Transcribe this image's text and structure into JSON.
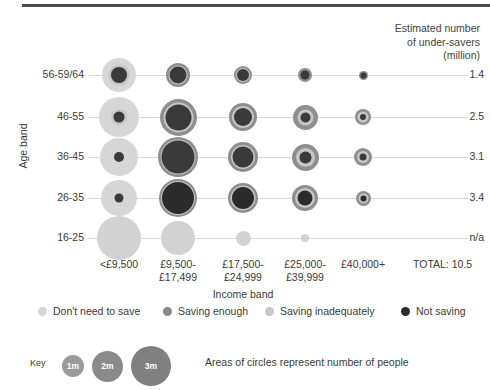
{
  "header_note": {
    "line1": "Estimated number",
    "line2": "of under-savers",
    "line3": "(million)"
  },
  "axis": {
    "y_title": "Age band",
    "x_title": "Income band"
  },
  "legend": {
    "items": [
      {
        "label": "Don't need to save",
        "color": "#d6d6d6"
      },
      {
        "label": "Saving enough",
        "color": "#8a8a8a"
      },
      {
        "label": "Saving inadequately",
        "color": "#c6c6c6"
      },
      {
        "label": "Not saving",
        "color": "#2b2b2b"
      }
    ]
  },
  "key": {
    "label": "Key",
    "note": "Areas of circles represent number of people",
    "sizes": [
      {
        "label": "1m",
        "d": 22,
        "color": "#9a9a9a"
      },
      {
        "label": "2m",
        "d": 31,
        "color": "#8a8a8a"
      },
      {
        "label": "3m",
        "d": 40,
        "color": "#808080"
      }
    ]
  },
  "chart_data": {
    "type": "bubble",
    "xlabel": "Income band",
    "ylabel": "Age band",
    "categories": [
      "<£9,500",
      "£9,500-\n£17,499",
      "£17,500-\n£24,999",
      "£25,000-\n£39,999",
      "£40,000+"
    ],
    "x_labels": [
      {
        "l1": "<£9,500",
        "l2": ""
      },
      {
        "l1": "£9,500-",
        "l2": "£17,499"
      },
      {
        "l1": "£17,500-",
        "l2": "£24,999"
      },
      {
        "l1": "£25,000-",
        "l2": "£39,999"
      },
      {
        "l1": "£40,000+",
        "l2": ""
      }
    ],
    "total_label": "TOTAL: 10.5",
    "rows": [
      {
        "age": "56-59/64",
        "under_savers": "1.4"
      },
      {
        "age": "46-55",
        "under_savers": "2.5"
      },
      {
        "age": "36-45",
        "under_savers": "3.1"
      },
      {
        "age": "26-35",
        "under_savers": "3.4"
      },
      {
        "age": "16-25",
        "under_savers": "n/a"
      }
    ],
    "series": [
      {
        "name": "Don't need to save",
        "color": "#d6d6d6"
      },
      {
        "name": "Saving enough",
        "color": "#8a8a8a"
      },
      {
        "name": "Saving inadequately",
        "color": "#c6c6c6"
      },
      {
        "name": "Not saving",
        "color": "#2b2b2b"
      }
    ],
    "bubbles": [
      {
        "row": 0,
        "col": 0,
        "rings": [
          {
            "series": "Don't need to save",
            "color": "#d6d6d6",
            "d": 34
          },
          {
            "series": "Saving inadequately",
            "color": "#c6c6c6",
            "d": 21
          },
          {
            "series": "Not saving",
            "color": "#3a3a3a",
            "d": 16
          }
        ]
      },
      {
        "row": 0,
        "col": 1,
        "rings": [
          {
            "series": "Saving enough",
            "color": "#8e8e8e",
            "d": 24
          },
          {
            "series": "Saving inadequately",
            "color": "#c6c6c6",
            "d": 19
          },
          {
            "series": "Not saving",
            "color": "#3a3a3a",
            "d": 17
          }
        ]
      },
      {
        "row": 0,
        "col": 2,
        "rings": [
          {
            "series": "Saving enough",
            "color": "#8e8e8e",
            "d": 18
          },
          {
            "series": "Saving inadequately",
            "color": "#c6c6c6",
            "d": 14
          },
          {
            "series": "Not saving",
            "color": "#3a3a3a",
            "d": 12
          }
        ]
      },
      {
        "row": 0,
        "col": 3,
        "rings": [
          {
            "series": "Saving enough",
            "color": "#8e8e8e",
            "d": 14
          },
          {
            "series": "Not saving",
            "color": "#3a3a3a",
            "d": 9
          }
        ]
      },
      {
        "row": 0,
        "col": 4,
        "rings": [
          {
            "series": "Saving enough",
            "color": "#8e8e8e",
            "d": 9
          },
          {
            "series": "Not saving",
            "color": "#3a3a3a",
            "d": 6
          }
        ]
      },
      {
        "row": 1,
        "col": 0,
        "rings": [
          {
            "series": "Don't need to save",
            "color": "#d6d6d6",
            "d": 40
          },
          {
            "series": "Saving inadequately",
            "color": "#c6c6c6",
            "d": 16
          },
          {
            "series": "Not saving",
            "color": "#3a3a3a",
            "d": 11
          }
        ]
      },
      {
        "row": 1,
        "col": 1,
        "rings": [
          {
            "series": "Saving enough",
            "color": "#8e8e8e",
            "d": 37
          },
          {
            "series": "Saving inadequately",
            "color": "#c6c6c6",
            "d": 30
          },
          {
            "series": "Not saving",
            "color": "#3a3a3a",
            "d": 26
          }
        ]
      },
      {
        "row": 1,
        "col": 2,
        "rings": [
          {
            "series": "Saving enough",
            "color": "#8e8e8e",
            "d": 28
          },
          {
            "series": "Saving inadequately",
            "color": "#c6c6c6",
            "d": 22
          },
          {
            "series": "Not saving",
            "color": "#3a3a3a",
            "d": 18
          }
        ]
      },
      {
        "row": 1,
        "col": 3,
        "rings": [
          {
            "series": "Saving enough",
            "color": "#8e8e8e",
            "d": 25
          },
          {
            "series": "Saving inadequately",
            "color": "#c6c6c6",
            "d": 16
          },
          {
            "series": "Not saving",
            "color": "#3a3a3a",
            "d": 10
          }
        ]
      },
      {
        "row": 1,
        "col": 4,
        "rings": [
          {
            "series": "Saving enough",
            "color": "#8e8e8e",
            "d": 16
          },
          {
            "series": "Saving inadequately",
            "color": "#c6c6c6",
            "d": 11
          },
          {
            "series": "Not saving",
            "color": "#3a3a3a",
            "d": 6
          }
        ]
      },
      {
        "row": 2,
        "col": 0,
        "rings": [
          {
            "series": "Don't need to save",
            "color": "#d6d6d6",
            "d": 38
          },
          {
            "series": "Not saving",
            "color": "#3a3a3a",
            "d": 10
          }
        ]
      },
      {
        "row": 2,
        "col": 1,
        "rings": [
          {
            "series": "Saving enough",
            "color": "#8e8e8e",
            "d": 40
          },
          {
            "series": "Saving inadequately",
            "color": "#c6c6c6",
            "d": 35
          },
          {
            "series": "Not saving",
            "color": "#3a3a3a",
            "d": 33
          }
        ]
      },
      {
        "row": 2,
        "col": 2,
        "rings": [
          {
            "series": "Saving enough",
            "color": "#8e8e8e",
            "d": 30
          },
          {
            "series": "Saving inadequately",
            "color": "#c6c6c6",
            "d": 24
          },
          {
            "series": "Not saving",
            "color": "#3a3a3a",
            "d": 21
          }
        ]
      },
      {
        "row": 2,
        "col": 3,
        "rings": [
          {
            "series": "Saving enough",
            "color": "#8e8e8e",
            "d": 27
          },
          {
            "series": "Saving inadequately",
            "color": "#c6c6c6",
            "d": 19
          },
          {
            "series": "Not saving",
            "color": "#3a3a3a",
            "d": 12
          }
        ]
      },
      {
        "row": 2,
        "col": 4,
        "rings": [
          {
            "series": "Saving enough",
            "color": "#8e8e8e",
            "d": 18
          },
          {
            "series": "Saving inadequately",
            "color": "#c6c6c6",
            "d": 12
          },
          {
            "series": "Not saving",
            "color": "#3a3a3a",
            "d": 7
          }
        ]
      },
      {
        "row": 3,
        "col": 0,
        "rings": [
          {
            "series": "Don't need to save",
            "color": "#d6d6d6",
            "d": 36
          },
          {
            "series": "Not saving",
            "color": "#3a3a3a",
            "d": 9
          }
        ]
      },
      {
        "row": 3,
        "col": 1,
        "rings": [
          {
            "series": "Saving enough",
            "color": "#8e8e8e",
            "d": 38
          },
          {
            "series": "Saving inadequately",
            "color": "#c6c6c6",
            "d": 34
          },
          {
            "series": "Not saving",
            "color": "#2b2b2b",
            "d": 32
          }
        ]
      },
      {
        "row": 3,
        "col": 2,
        "rings": [
          {
            "series": "Saving enough",
            "color": "#8e8e8e",
            "d": 30
          },
          {
            "series": "Saving inadequately",
            "color": "#c6c6c6",
            "d": 25
          },
          {
            "series": "Not saving",
            "color": "#2b2b2b",
            "d": 22
          }
        ]
      },
      {
        "row": 3,
        "col": 3,
        "rings": [
          {
            "series": "Saving enough",
            "color": "#8e8e8e",
            "d": 26
          },
          {
            "series": "Saving inadequately",
            "color": "#c6c6c6",
            "d": 20
          },
          {
            "series": "Not saving",
            "color": "#2b2b2b",
            "d": 15
          }
        ]
      },
      {
        "row": 3,
        "col": 4,
        "rings": [
          {
            "series": "Saving enough",
            "color": "#8e8e8e",
            "d": 15
          },
          {
            "series": "Saving inadequately",
            "color": "#c6c6c6",
            "d": 10
          },
          {
            "series": "Not saving",
            "color": "#2b2b2b",
            "d": 6
          }
        ]
      },
      {
        "row": 4,
        "col": 0,
        "rings": [
          {
            "series": "Don't need to save",
            "color": "#d2d2d2",
            "d": 44
          }
        ]
      },
      {
        "row": 4,
        "col": 1,
        "rings": [
          {
            "series": "Don't need to save",
            "color": "#d2d2d2",
            "d": 34
          }
        ]
      },
      {
        "row": 4,
        "col": 2,
        "rings": [
          {
            "series": "Don't need to save",
            "color": "#d2d2d2",
            "d": 15
          }
        ]
      },
      {
        "row": 4,
        "col": 3,
        "rings": [
          {
            "series": "Don't need to save",
            "color": "#d2d2d2",
            "d": 8
          }
        ]
      }
    ],
    "layout": {
      "col_x": [
        119,
        178,
        243,
        305,
        363
      ],
      "row_y": [
        75,
        117,
        157,
        198,
        238
      ],
      "grid": true,
      "legend_position": "bottom"
    }
  }
}
